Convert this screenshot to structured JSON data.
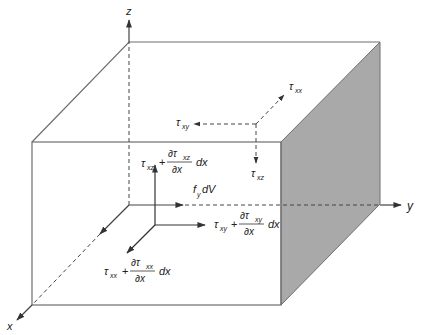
{
  "diagram": {
    "type": "3d-differential-element",
    "colors": {
      "edge": "#6e6e6e",
      "shaded_face": "#a9a9a9",
      "text": "#222222",
      "background": "#ffffff"
    },
    "axes": {
      "x": "x",
      "y": "y",
      "z": "z"
    },
    "back_face_stresses": {
      "normal": {
        "symbol": "τ",
        "sub": "xx"
      },
      "shear_y": {
        "symbol": "τ",
        "sub": "xy"
      },
      "shear_z": {
        "symbol": "τ",
        "sub": "xz"
      }
    },
    "front_face_stresses": {
      "normal": {
        "symbol": "τ",
        "sub": "xx",
        "plus": "+",
        "partial_num": "∂τ",
        "partial_num_sub": "xx",
        "partial_den": "∂x",
        "dx": "dx"
      },
      "shear_y": {
        "symbol": "τ",
        "sub": "xy",
        "plus": "+",
        "partial_num": "∂τ",
        "partial_num_sub": "xy",
        "partial_den": "∂x",
        "dx": "dx"
      },
      "shear_z": {
        "symbol": "τ",
        "sub": "xz",
        "plus": "+",
        "partial_num": "∂τ",
        "partial_num_sub": "xz",
        "partial_den": "∂x",
        "dx": "dx"
      }
    },
    "body_force": {
      "f": "f",
      "sub": "y",
      "dv": "dV"
    }
  }
}
